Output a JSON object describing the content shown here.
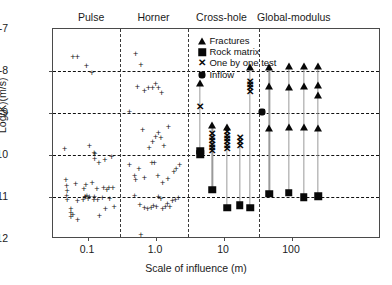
{
  "chart_data": {
    "type": "scatter",
    "title": "",
    "xlabel": "Scale of influence (m)",
    "ylabel": "Log(K)(m/s)",
    "xscale": "log",
    "xlim": [
      0.04,
      300
    ],
    "ylim": [
      -12,
      -7
    ],
    "xticks": [
      0.1,
      1.0,
      10,
      100
    ],
    "xticklabels": [
      "0.1",
      "1.0",
      "10",
      "100"
    ],
    "yticks": [
      -7,
      -8,
      -9,
      -10,
      -11,
      -12
    ],
    "yticklabels": [
      "-7",
      "-8",
      "-9",
      "-10",
      "-11",
      "-12"
    ],
    "grid": "horizontal-dashed",
    "legend_position": "top-center-right",
    "regions": [
      {
        "label": "Pulse",
        "x_center": 0.115,
        "boundary_right": 0.3
      },
      {
        "label": "Horner",
        "x_center": 0.95,
        "boundary_right": 3.0
      },
      {
        "label": "Cross-hole",
        "x_center": 9.5,
        "boundary_right": 33.0
      },
      {
        "label": "Global-modulus",
        "x_center": 110,
        "boundary_right": null
      }
    ],
    "legend": [
      {
        "marker": "triangle",
        "label": "Fractures"
      },
      {
        "marker": "square",
        "label": "Rock matrix"
      },
      {
        "marker": "x",
        "label": "One by one test"
      },
      {
        "marker": "pentagon",
        "label": "Inflow"
      }
    ],
    "series": [
      {
        "name": "Pulse tests",
        "marker": "plus",
        "points": [
          [
            0.062,
            -7.68
          ],
          [
            0.072,
            -7.68
          ],
          [
            0.098,
            -7.9
          ],
          [
            0.118,
            -8.07
          ],
          [
            0.047,
            -9.87
          ],
          [
            0.108,
            -9.82
          ],
          [
            0.127,
            -9.97
          ],
          [
            0.131,
            -9.99
          ],
          [
            0.129,
            -10.12
          ],
          [
            0.15,
            -10.22
          ],
          [
            0.183,
            -10.15
          ],
          [
            0.23,
            -10.08
          ],
          [
            0.049,
            -10.62
          ],
          [
            0.05,
            -10.77
          ],
          [
            0.051,
            -10.88
          ],
          [
            0.05,
            -11.0
          ],
          [
            0.051,
            -11.09
          ],
          [
            0.058,
            -11.3
          ],
          [
            0.058,
            -11.4
          ],
          [
            0.058,
            -11.5
          ],
          [
            0.062,
            -11.45
          ],
          [
            0.068,
            -10.72
          ],
          [
            0.072,
            -11.13
          ],
          [
            0.073,
            -11.58
          ],
          [
            0.088,
            -11.1
          ],
          [
            0.09,
            -10.83
          ],
          [
            0.093,
            -11.03
          ],
          [
            0.095,
            -11.02
          ],
          [
            0.096,
            -10.73
          ],
          [
            0.1,
            -11.0
          ],
          [
            0.104,
            -11.07
          ],
          [
            0.108,
            -11.03
          ],
          [
            0.119,
            -10.68
          ],
          [
            0.126,
            -11.1
          ],
          [
            0.128,
            -11.02
          ],
          [
            0.14,
            -10.84
          ],
          [
            0.143,
            -11.1
          ],
          [
            0.152,
            -11.48
          ],
          [
            0.168,
            -11.05
          ],
          [
            0.175,
            -10.8
          ],
          [
            0.186,
            -11.3
          ],
          [
            0.196,
            -10.86
          ],
          [
            0.21,
            -10.82
          ],
          [
            0.215,
            -11.08
          ],
          [
            0.24,
            -10.82
          ],
          [
            0.25,
            -11.25
          ]
        ]
      },
      {
        "name": "Horner tests",
        "marker": "plus",
        "points": [
          [
            0.52,
            -7.63
          ],
          [
            0.62,
            -7.87
          ],
          [
            0.55,
            -8.4
          ],
          [
            0.7,
            -8.5
          ],
          [
            0.8,
            -8.44
          ],
          [
            0.92,
            -8.42
          ],
          [
            1.02,
            -8.33
          ],
          [
            1.12,
            -8.42
          ],
          [
            1.25,
            -8.55
          ],
          [
            0.42,
            -9.0
          ],
          [
            0.66,
            -9.42
          ],
          [
            0.82,
            -9.85
          ],
          [
            0.92,
            -9.72
          ],
          [
            1.02,
            -9.6
          ],
          [
            1.12,
            -9.5
          ],
          [
            1.22,
            -9.62
          ],
          [
            1.35,
            -9.8
          ],
          [
            1.58,
            -9.35
          ],
          [
            0.42,
            -10.25
          ],
          [
            0.5,
            -10.52
          ],
          [
            0.52,
            -10.63
          ],
          [
            0.58,
            -10.35
          ],
          [
            0.7,
            -10.58
          ],
          [
            0.9,
            -10.22
          ],
          [
            0.98,
            -10.22
          ],
          [
            1.1,
            -10.52
          ],
          [
            1.3,
            -10.7
          ],
          [
            1.55,
            -10.6
          ],
          [
            1.9,
            -10.42
          ],
          [
            2.05,
            -10.35
          ],
          [
            2.3,
            -10.25
          ],
          [
            0.5,
            -11.0
          ],
          [
            0.6,
            -11.22
          ],
          [
            0.7,
            -11.28
          ],
          [
            0.78,
            -11.3
          ],
          [
            0.88,
            -11.28
          ],
          [
            0.95,
            -11.23
          ],
          [
            1.05,
            -11.25
          ],
          [
            1.12,
            -11.02
          ],
          [
            1.22,
            -11.08
          ],
          [
            1.3,
            -11.3
          ],
          [
            1.42,
            -11.25
          ],
          [
            1.52,
            -11.2
          ],
          [
            1.65,
            -11.25
          ],
          [
            1.8,
            -11.12
          ],
          [
            2.0,
            -11.1
          ],
          [
            2.2,
            -11.05
          ],
          [
            0.62,
            -11.93
          ]
        ]
      },
      {
        "name": "Cross-hole stems",
        "marker": "stem",
        "stems": [
          {
            "x": 4.6,
            "top": -8.32,
            "bottom": -9.95,
            "fractures": [
              -8.32
            ],
            "matrix": [
              -9.92,
              -10.0
            ],
            "tests": [
              -8.88
            ]
          },
          {
            "x": 7.0,
            "top": -9.32,
            "bottom": -10.85,
            "fractures": [
              -9.32
            ],
            "matrix": [
              -10.85
            ],
            "tests": [
              -9.52,
              -9.62,
              -9.7,
              -9.78,
              -9.86,
              -9.94
            ]
          },
          {
            "x": 11.5,
            "top": -9.35,
            "bottom": -11.28,
            "fractures": [
              -9.35
            ],
            "matrix": [
              -11.28
            ],
            "tests": [
              -9.48,
              -9.56,
              -9.64,
              -9.72,
              -9.8,
              -9.88
            ]
          },
          {
            "x": 17.5,
            "top": -9.62,
            "bottom": -11.22,
            "fractures": [],
            "matrix": [
              -11.22
            ],
            "tests": [
              -9.62,
              -9.72,
              -9.82
            ]
          },
          {
            "x": 25.0,
            "top": -7.92,
            "bottom": -11.28,
            "fractures": [
              -7.92
            ],
            "matrix": [
              -11.28
            ],
            "tests": [
              -8.28,
              -8.36,
              -8.44,
              -8.52
            ]
          }
        ]
      },
      {
        "name": "Global-modulus stems",
        "marker": "stem",
        "stems": [
          {
            "x": 48,
            "top": -7.92,
            "bottom": -10.95,
            "fractures": [
              -7.92,
              -8.38,
              -9.38
            ],
            "matrix": [
              -10.95
            ],
            "tests": []
          },
          {
            "x": 92,
            "top": -7.9,
            "bottom": -10.92,
            "fractures": [
              -7.9,
              -8.4,
              -9.35
            ],
            "matrix": [
              -10.92
            ],
            "tests": []
          },
          {
            "x": 155,
            "top": -7.9,
            "bottom": -11.03,
            "fractures": [
              -7.9,
              -8.38,
              -9.35
            ],
            "matrix": [
              -11.03
            ],
            "tests": []
          },
          {
            "x": 250,
            "top": -7.9,
            "bottom": -11.0,
            "fractures": [
              -7.9,
              -8.35,
              -8.6,
              -9.38
            ],
            "matrix": [
              -11.0
            ],
            "tests": []
          }
        ]
      },
      {
        "name": "Inflow",
        "marker": "pentagon",
        "points": [
          [
            37,
            -9.0
          ]
        ]
      }
    ]
  }
}
